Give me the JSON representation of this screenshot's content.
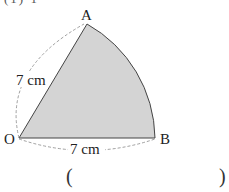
{
  "diagram": {
    "type": "circular-sector",
    "points": {
      "O": {
        "label": "O",
        "x": 19,
        "y": 138
      },
      "A": {
        "label": "A",
        "x": 87,
        "y": 24
      },
      "B": {
        "label": "B",
        "x": 155,
        "y": 138
      }
    },
    "measurements": {
      "OA": "7 cm",
      "OB": "7 cm"
    },
    "fill_color": "#d4d4d4",
    "stroke_color": "#444444"
  },
  "answer": {
    "open_paren": "(",
    "close_paren": ")"
  }
}
